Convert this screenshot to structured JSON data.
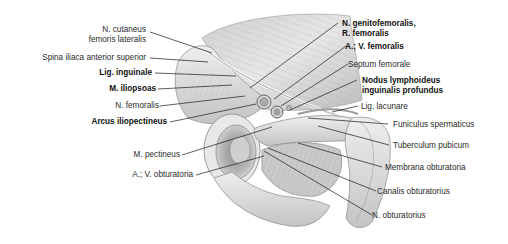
{
  "figure": {
    "type": "anatomical-illustration",
    "colors": {
      "background": "#ffffff",
      "text": "#2a2a2a",
      "leader": "#1a1a1a"
    }
  },
  "labels_left": [
    {
      "id": "n-cutaneus",
      "line1": "N. cutaneus",
      "line2": "femoris lateralis",
      "bold": false
    },
    {
      "id": "spina-iliaca",
      "line1": "Spina iliaca anterior superior",
      "bold": false
    },
    {
      "id": "lig-inguinale",
      "line1": "Lig. inguinale",
      "bold": true
    },
    {
      "id": "m-iliopsoas",
      "line1": "M. iliopsoas",
      "bold": true
    },
    {
      "id": "n-femoralis",
      "line1": "N. femoralis",
      "bold": false
    },
    {
      "id": "arcus-iliopectineus",
      "line1": "Arcus iliopectineus",
      "bold": true
    },
    {
      "id": "m-pectineus",
      "line1": "M. pectineus",
      "bold": false
    },
    {
      "id": "av-obturatoria",
      "line1": "A.; V. obturatoria",
      "bold": false
    }
  ],
  "labels_right": [
    {
      "id": "n-genitofemoralis",
      "line1": "N. genitofemoralis,",
      "line2": "R. femoralis",
      "bold": true
    },
    {
      "id": "av-femoralis",
      "line1": "A.; V. femoralis",
      "bold": true
    },
    {
      "id": "septum-femorale",
      "line1": "Septum femorale",
      "bold": false
    },
    {
      "id": "nodus-lymphoideus",
      "line1": "Nodus lymphoideus",
      "line2": "inguinalis profundus",
      "bold": true
    },
    {
      "id": "lig-lacunare",
      "line1": "Lig. lacunare",
      "bold": false
    },
    {
      "id": "funiculus",
      "line1": "Funiculus spermaticus",
      "bold": false
    },
    {
      "id": "tuberculum",
      "line1": "Tuberculum pubicum",
      "bold": false
    },
    {
      "id": "membrana",
      "line1": "Membrana obturatoria",
      "bold": false
    },
    {
      "id": "canalis",
      "line1": "Canalis obturatorius",
      "bold": false
    },
    {
      "id": "n-obturatorius",
      "line1": "N. obturatorius",
      "bold": false
    }
  ]
}
